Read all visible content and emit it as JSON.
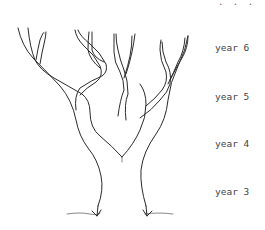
{
  "diagram": {
    "continuation_marker": ". . .",
    "year_labels": [
      {
        "label": "year 6",
        "y": 48
      },
      {
        "label": "year 5",
        "y": 97
      },
      {
        "label": "year 4",
        "y": 144
      },
      {
        "label": "year 3",
        "y": 192
      }
    ],
    "colors": {
      "background": "#ffffff",
      "line": "#2a2a2a",
      "text": "#444444"
    }
  }
}
